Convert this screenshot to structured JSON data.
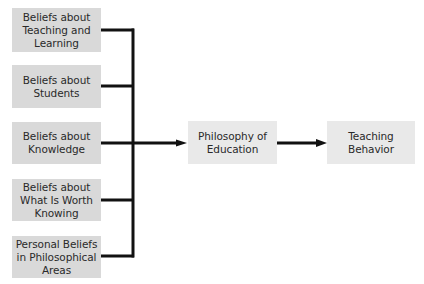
{
  "diagram": {
    "sources": [
      {
        "label": "Beliefs about\nTeaching and\nLearning"
      },
      {
        "label": "Beliefs about\nStudents"
      },
      {
        "label": "Beliefs about\nKnowledge"
      },
      {
        "label": "Beliefs about\nWhat Is Worth\nKnowing"
      },
      {
        "label": "Personal Beliefs\nin Philosophical\nAreas"
      }
    ],
    "center": {
      "label": "Philosophy  of\nEducation"
    },
    "outcome": {
      "label": "Teaching\nBehavior"
    },
    "colors": {
      "source_fill": "#d9d9d9",
      "node_fill": "#e9e9e9",
      "line": "#111111"
    }
  }
}
